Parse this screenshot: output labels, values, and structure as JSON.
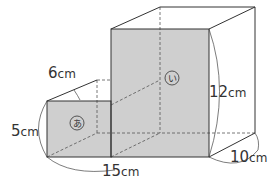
{
  "diagram": {
    "type": "composite-rectangular-prisms",
    "colors": {
      "face_fill": "#cfcfcf",
      "line": "#333333",
      "dashed": "#555555",
      "bg": "#ffffff"
    },
    "labels": {
      "small_depth": {
        "num": "6",
        "unit": "cm"
      },
      "small_height": {
        "num": "5",
        "unit": "cm"
      },
      "total_width": {
        "num": "15",
        "unit": "cm"
      },
      "big_height": {
        "num": "12",
        "unit": "cm"
      },
      "big_depth": {
        "num": "10",
        "unit": "cm"
      },
      "mark_a": "あ",
      "mark_i": "い"
    }
  }
}
